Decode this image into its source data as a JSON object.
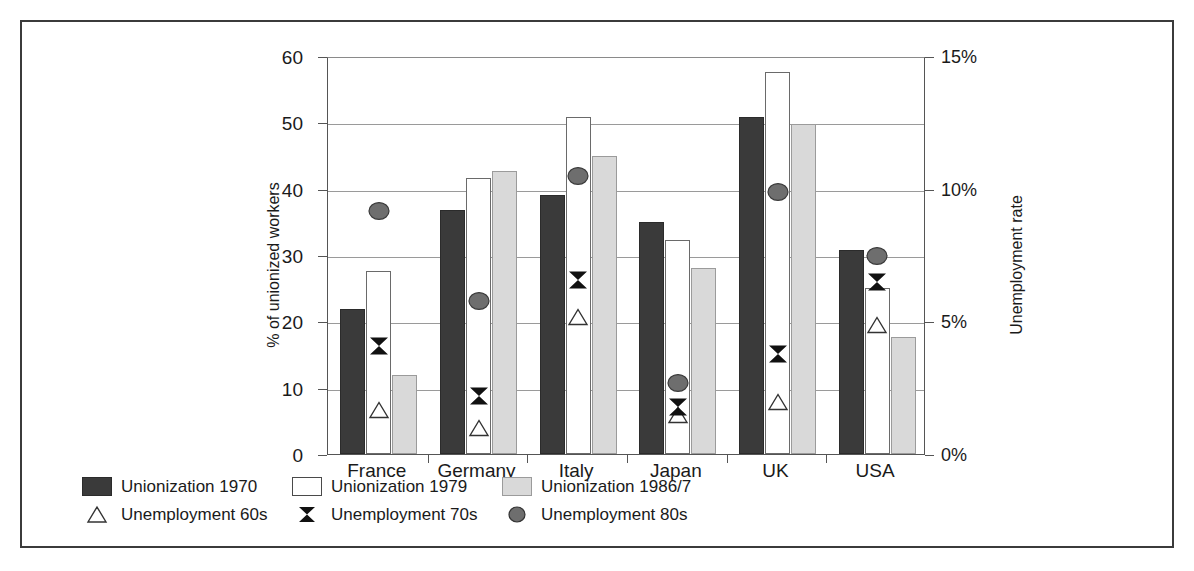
{
  "chart_data": {
    "type": "bar",
    "title": "",
    "subtitle": "",
    "categories": [
      "France",
      "Germany",
      "Italy",
      "Japan",
      "UK",
      "USA"
    ],
    "xlabel": "",
    "ylabel": "% of unionized workers",
    "ylabel_secondary": "Unemployment rate",
    "ylim": [
      0,
      60
    ],
    "yticks": [
      0,
      10,
      20,
      30,
      40,
      50,
      60
    ],
    "ytick_labels": [
      "0",
      "10",
      "20",
      "30",
      "40",
      "50",
      "60"
    ],
    "ylim_secondary": [
      0,
      15
    ],
    "yticks_secondary": [
      0,
      5,
      10,
      15
    ],
    "ytick_labels_secondary": [
      "0%",
      "5%",
      "10%",
      "15%"
    ],
    "grid": true,
    "legend_position": "bottom",
    "bar_series": [
      {
        "name": "Unionization 1970",
        "color": "#3a3a3a",
        "axis": "left",
        "values": [
          21.8,
          36.8,
          39.0,
          35.0,
          50.8,
          30.8
        ]
      },
      {
        "name": "Unionization 1979",
        "color": "#ffffff",
        "axis": "left",
        "values": [
          27.6,
          41.6,
          50.8,
          32.2,
          57.6,
          25.0
        ]
      },
      {
        "name": "Unionization 1986/7",
        "color": "#d9d9d9",
        "axis": "left",
        "values": [
          11.9,
          42.6,
          44.9,
          28.0,
          49.8,
          17.6
        ]
      }
    ],
    "marker_series": [
      {
        "name": "Unemployment 60s",
        "marker": "triangle",
        "color": "#ffffff",
        "axis": "right",
        "values": [
          1.6,
          0.9,
          5.1,
          1.4,
          1.9,
          4.8
        ]
      },
      {
        "name": "Unemployment 70s",
        "marker": "bowtie",
        "color": "#111111",
        "axis": "right",
        "values": [
          4.0,
          2.1,
          6.5,
          1.7,
          3.7,
          6.4
        ]
      },
      {
        "name": "Unemployment 80s",
        "marker": "circle",
        "color": "#6e6e6e",
        "axis": "right",
        "values": [
          9.1,
          5.7,
          10.4,
          2.6,
          9.8,
          7.4
        ]
      }
    ]
  },
  "axes": {
    "left_title": "% of unionized workers",
    "right_title": "Unemployment rate",
    "left_ticks": [
      "60",
      "50",
      "40",
      "30",
      "20",
      "10",
      "0"
    ],
    "right_ticks": [
      "15%",
      "10%",
      "5%",
      "0%"
    ],
    "category_labels": [
      "France",
      "Germany",
      "Italy",
      "Japan",
      "UK",
      "USA"
    ]
  },
  "legend": {
    "row1": [
      {
        "label": "Unionization 1970",
        "swatch": "filled-dark-square-icon"
      },
      {
        "label": "Unionization 1979",
        "swatch": "outlined-white-square-icon"
      },
      {
        "label": "Unionization 1986/7",
        "swatch": "filled-light-square-icon"
      }
    ],
    "row2": [
      {
        "label": "Unemployment 60s",
        "swatch": "triangle-marker-icon"
      },
      {
        "label": "Unemployment 70s",
        "swatch": "bowtie-marker-icon"
      },
      {
        "label": "Unemployment 80s",
        "swatch": "circle-marker-icon"
      }
    ]
  },
  "colors": {
    "series_1970": "#3a3a3a",
    "series_1979": "#ffffff",
    "series_1986": "#d9d9d9",
    "marker_60s": "#ffffff",
    "marker_70s": "#111111",
    "marker_80s": "#6e6e6e",
    "frame": "#3b3b3b",
    "grid": "#9a9a9a"
  }
}
